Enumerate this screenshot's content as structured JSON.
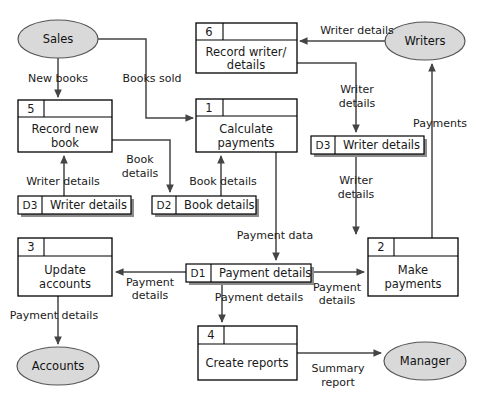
{
  "diagram": {
    "type": "data-flow-diagram",
    "colors": {
      "entity_fill": "#d9d9d9",
      "entity_stroke": "#555555",
      "box_stroke": "#000000",
      "flow_stroke": "#444444",
      "store_shadow": "#8c8c8c",
      "background": "#ffffff"
    },
    "external_entities": [
      {
        "id": "sales",
        "label": "Sales",
        "cx": 58,
        "cy": 39,
        "rx": 40,
        "ry": 19
      },
      {
        "id": "writers",
        "label": "Writers",
        "cx": 425,
        "cy": 41,
        "rx": 40,
        "ry": 19
      },
      {
        "id": "accounts",
        "label": "Accounts",
        "cx": 58,
        "cy": 366,
        "rx": 41,
        "ry": 19
      },
      {
        "id": "manager",
        "label": "Manager",
        "cx": 425,
        "cy": 361,
        "rx": 41,
        "ry": 19
      }
    ],
    "processes": [
      {
        "id": "p5",
        "number": "5",
        "line1": "Record new",
        "line2": "book",
        "x": 18,
        "y": 100,
        "w": 94,
        "h": 52
      },
      {
        "id": "p6",
        "number": "6",
        "line1": "Record writer/",
        "line2": "details",
        "x": 196,
        "y": 23,
        "w": 101,
        "h": 50
      },
      {
        "id": "p1",
        "number": "1",
        "line1": "Calculate",
        "line2": "payments",
        "x": 196,
        "y": 99,
        "w": 101,
        "h": 53
      },
      {
        "id": "p3",
        "number": "3",
        "line1": "Update",
        "line2": "accounts",
        "x": 18,
        "y": 238,
        "w": 94,
        "h": 58
      },
      {
        "id": "p2",
        "number": "2",
        "line1": "Make",
        "line2": "payments",
        "x": 368,
        "y": 238,
        "w": 90,
        "h": 58
      },
      {
        "id": "p4",
        "number": "4",
        "line1": "Create reports",
        "line2": "",
        "x": 198,
        "y": 326,
        "w": 99,
        "h": 54
      }
    ],
    "data_stores": [
      {
        "id": "d3a",
        "code": "D3",
        "label": "Writer details",
        "x": 18,
        "y": 196,
        "w": 113,
        "h": 18
      },
      {
        "id": "d2",
        "code": "D2",
        "label": "Book details",
        "x": 152,
        "y": 196,
        "w": 104,
        "h": 18
      },
      {
        "id": "d3b",
        "code": "D3",
        "label": "Writer details",
        "x": 311,
        "y": 136,
        "w": 113,
        "h": 18
      },
      {
        "id": "d1",
        "code": "D1",
        "label": "Payment details",
        "x": 186,
        "y": 264,
        "w": 125,
        "h": 18
      }
    ],
    "data_flows": [
      {
        "id": "f-new-books",
        "label": "New books",
        "from": "sales",
        "to": "p5"
      },
      {
        "id": "f-books-sold",
        "label": "Books sold",
        "from": "sales",
        "to": "p1"
      },
      {
        "id": "f-writer-details-writers",
        "label": "Writer details",
        "from": "writers",
        "to": "p6"
      },
      {
        "id": "f-writer-details-store",
        "label_line1": "Writer",
        "label_line2": "details",
        "from": "p6",
        "to": "d3b"
      },
      {
        "id": "f-book-details-store",
        "label_line1": "Book",
        "label_line2": "details",
        "from": "p5",
        "to": "d2"
      },
      {
        "id": "f-book-details-calc",
        "label": "Book details",
        "from": "d2",
        "to": "p1"
      },
      {
        "id": "f-writer-details-p5",
        "label": "Writer details",
        "from": "d3a",
        "to": "p5"
      },
      {
        "id": "f-writer-details-p2",
        "label_line1": "Writer",
        "label_line2": "details",
        "from": "d3b",
        "to": "p2"
      },
      {
        "id": "f-payments",
        "label": "Payments",
        "from": "p2",
        "to": "writers"
      },
      {
        "id": "f-payment-data",
        "label": "Payment data",
        "from": "p1",
        "to": "d1"
      },
      {
        "id": "f-payment-details-p3",
        "label_line1": "Payment",
        "label_line2": "details",
        "from": "d1",
        "to": "p3"
      },
      {
        "id": "f-payment-details-p2",
        "label_line1": "Payment",
        "label_line2": "details",
        "from": "d1",
        "to": "p2"
      },
      {
        "id": "f-payment-details-p4",
        "label": "Payment details",
        "from": "d1",
        "to": "p4"
      },
      {
        "id": "f-payment-details-accounts",
        "label": "Payment details",
        "from": "p3",
        "to": "accounts"
      },
      {
        "id": "f-summary-report",
        "label_line1": "Summary",
        "label_line2": "report",
        "from": "p4",
        "to": "manager"
      }
    ]
  }
}
